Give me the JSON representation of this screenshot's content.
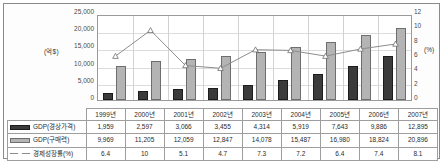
{
  "chart_data": {
    "type": "bar",
    "title": "",
    "categories": [
      "1999년",
      "2000년",
      "2001년",
      "2002년",
      "2003년",
      "2004년",
      "2005년",
      "2006년",
      "2007년"
    ],
    "series": [
      {
        "name": "GDP(경상가격)",
        "axis": "left",
        "type": "bar",
        "color": "#3b3b3b",
        "values": [
          1959,
          2597,
          3066,
          3455,
          4314,
          5919,
          7643,
          9886,
          12895
        ]
      },
      {
        "name": "GDP(구매력)",
        "axis": "left",
        "type": "bar",
        "color": "#b4b4b4",
        "values": [
          9969,
          11205,
          12059,
          12847,
          14078,
          15487,
          16980,
          18824,
          20896
        ]
      },
      {
        "name": "경제성장률(%)",
        "axis": "right",
        "type": "line",
        "color": "#8d8d8d",
        "values": [
          6.4,
          10,
          5.1,
          4.7,
          7.3,
          7.2,
          6.4,
          7.4,
          8.1
        ]
      }
    ],
    "ylabel": "(억$)",
    "ylabel_right": "(%)",
    "xlabel": "",
    "ylim": [
      0,
      25000
    ],
    "ylim_right": [
      0,
      12
    ],
    "yticks": [
      "25,000",
      "20,000",
      "15,000",
      "10,000",
      "5,000",
      "0"
    ],
    "yticks_right": [
      "12",
      "10",
      "8",
      "6",
      "4",
      "2",
      "0"
    ],
    "grid": true,
    "legend_position": "table-left"
  },
  "table": {
    "year_header": [
      "1999년",
      "2000년",
      "2001년",
      "2002년",
      "2003년",
      "2004년",
      "2005년",
      "2006년",
      "2007년"
    ],
    "rows": [
      {
        "label": "GDP(경상가격)",
        "marker": "nominal",
        "values": [
          "1,959",
          "2,597",
          "3,066",
          "3,455",
          "4,314",
          "5,919",
          "7,643",
          "9,886",
          "12,895"
        ]
      },
      {
        "label": "GDP(구매력)",
        "marker": "ppp",
        "values": [
          "9,969",
          "11,205",
          "12,059",
          "12,847",
          "14,078",
          "15,487",
          "16,980",
          "18,824",
          "20,896"
        ]
      },
      {
        "label": "경제성장률(%)",
        "marker": "line",
        "values": [
          "6.4",
          "10",
          "5.1",
          "4.7",
          "7.3",
          "7.2",
          "6.4",
          "7.4",
          "8.1"
        ]
      }
    ]
  },
  "axes": {
    "left_unit": "(억$)",
    "right_unit": "(%)"
  }
}
